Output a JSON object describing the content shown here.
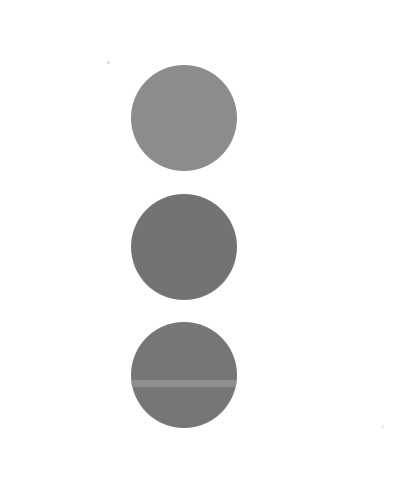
{
  "canvas": {
    "width": 415,
    "height": 490,
    "background": "#ffffff"
  },
  "circles": [
    {
      "name": "top-circle",
      "cx": 183.5,
      "cy": 118,
      "diameter": 106,
      "color": "#8c8c8c",
      "stripe": null
    },
    {
      "name": "middle-circle",
      "cx": 183.5,
      "cy": 246.5,
      "diameter": 106,
      "color": "#737373",
      "stripe": null
    },
    {
      "name": "bottom-circle",
      "cx": 183.5,
      "cy": 375,
      "diameter": 106,
      "color": "#767676",
      "stripe": {
        "top_offset": 58,
        "height": 7,
        "color": "#8f8f8f"
      }
    }
  ],
  "specks": [
    {
      "name": "speck-top-left",
      "x": 107,
      "y": 61,
      "size": 3,
      "color": "#d8d8d8"
    },
    {
      "name": "speck-bottom-right",
      "x": 381,
      "y": 425,
      "size": 3,
      "color": "#e6e6e6"
    }
  ]
}
